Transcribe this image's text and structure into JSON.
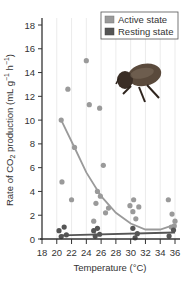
{
  "chart_data": {
    "type": "scatter",
    "title": "",
    "xlabel": "Temperature (°C)",
    "ylabel": "Rate of CO2 production (mL g⁻¹ h⁻¹)",
    "ylabel_parts": {
      "prefix": "Rate of CO",
      "sub": "2",
      "suffix": " production (mL g",
      "sup1": "−1",
      "mid": " h",
      "sup2": "−1",
      "end": ")"
    },
    "xlim": [
      18,
      36
    ],
    "ylim": [
      0,
      18
    ],
    "x_ticks": [
      18,
      20,
      22,
      24,
      26,
      28,
      30,
      32,
      34,
      36
    ],
    "y_ticks": [
      0,
      2,
      4,
      6,
      8,
      10,
      12,
      14,
      16,
      18
    ],
    "grid": {
      "vertical": true,
      "horizontal": false
    },
    "legend_position": "upper right",
    "legend": [
      {
        "label": "Active state",
        "color": "#9a9a9a"
      },
      {
        "label": "Resting state",
        "color": "#555555"
      }
    ],
    "series": [
      {
        "name": "Active state",
        "color": "#9a9a9a",
        "points": [
          [
            20.6,
            10.0
          ],
          [
            20.7,
            4.8
          ],
          [
            21.5,
            12.6
          ],
          [
            22.0,
            3.3
          ],
          [
            22.4,
            7.7
          ],
          [
            24.0,
            15.0
          ],
          [
            24.4,
            11.3
          ],
          [
            25.8,
            11.0
          ],
          [
            25.0,
            1.5
          ],
          [
            25.3,
            3.0
          ],
          [
            25.5,
            4.0
          ],
          [
            25.9,
            3.6
          ],
          [
            26.3,
            6.2
          ],
          [
            26.6,
            2.2
          ],
          [
            27.0,
            2.6
          ],
          [
            29.9,
            2.8
          ],
          [
            30.4,
            3.3
          ],
          [
            30.3,
            2.3
          ],
          [
            31.1,
            2.7
          ],
          [
            30.7,
            1.7
          ],
          [
            35.1,
            3.3
          ],
          [
            35.6,
            2.1
          ],
          [
            35.5,
            1.0
          ],
          [
            35.9,
            1.1
          ],
          [
            36.0,
            1.5
          ]
        ],
        "trend": [
          [
            20.6,
            10.0
          ],
          [
            22.4,
            7.7
          ],
          [
            24,
            5.6
          ],
          [
            26,
            3.6
          ],
          [
            28,
            2.2
          ],
          [
            30,
            1.3
          ],
          [
            32,
            0.8
          ],
          [
            34,
            0.8
          ],
          [
            35.5,
            1.1
          ]
        ]
      },
      {
        "name": "Resting state",
        "color": "#555555",
        "points": [
          [
            20.3,
            0.7
          ],
          [
            20.6,
            0.2
          ],
          [
            21.0,
            1.0
          ],
          [
            21.3,
            0.35
          ],
          [
            25.0,
            0.7
          ],
          [
            25.2,
            0.25
          ],
          [
            25.5,
            0.9
          ],
          [
            25.8,
            0.4
          ],
          [
            30.3,
            0.9
          ],
          [
            30.6,
            0.1
          ],
          [
            30.9,
            0.45
          ],
          [
            35.2,
            0.25
          ],
          [
            35.8,
            0.75
          ]
        ],
        "trend": [
          [
            20.6,
            0.3
          ],
          [
            36.0,
            0.55
          ]
        ]
      }
    ],
    "annotations": [
      "beetle illustration (upper right)"
    ]
  }
}
